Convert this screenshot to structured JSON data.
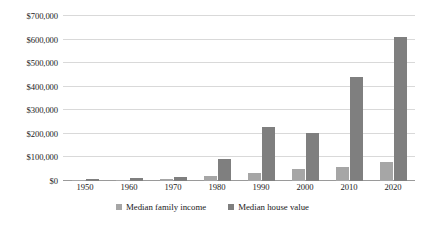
{
  "chart_data": {
    "type": "bar",
    "title": "",
    "subtitle": "",
    "xlabel": "",
    "ylabel": "",
    "categories": [
      "1950",
      "1960",
      "1970",
      "1980",
      "1990",
      "2000",
      "2010",
      "2020"
    ],
    "series": [
      {
        "name": "Median family income",
        "color": "#a6a6a6",
        "values": [
          3300,
          5600,
          9900,
          21000,
          35400,
          50700,
          60200,
          80100
        ]
      },
      {
        "name": "Median house value",
        "color": "#7f7f7f",
        "values": [
          7400,
          11900,
          17000,
          93000,
          230000,
          205000,
          440000,
          610000
        ]
      }
    ],
    "ylim": [
      0,
      700000
    ],
    "ytick_values": [
      0,
      100000,
      200000,
      300000,
      400000,
      500000,
      600000,
      700000
    ],
    "ytick_labels": [
      "$0",
      "$100,000",
      "$200,000",
      "$300,000",
      "$400,000",
      "$500,000",
      "$600,000",
      "$700,000"
    ],
    "grid": true,
    "legend_position": "bottom",
    "annotations": []
  },
  "legend": {
    "items": [
      {
        "label": "Median family income",
        "color": "#a6a6a6"
      },
      {
        "label": "Median house value",
        "color": "#7f7f7f"
      }
    ]
  }
}
